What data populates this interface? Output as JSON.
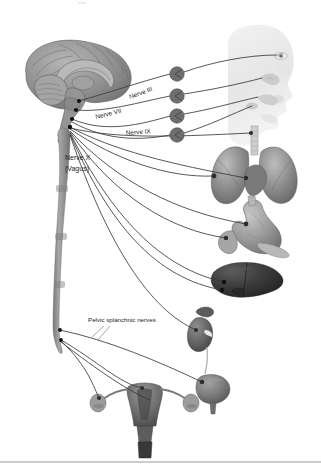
{
  "figure": {
    "background_color": "#ffffff",
    "width": 321,
    "height": 475
  },
  "labels": [
    {
      "id": "nerve-3",
      "text": "Nerve III",
      "x": 130,
      "y": 99,
      "rotate": -20,
      "size": 6.4
    },
    {
      "id": "nerve-7",
      "text": "Nerve VII",
      "x": 96,
      "y": 119,
      "rotate": -14,
      "size": 6.4
    },
    {
      "id": "nerve-9",
      "text": "Nerve IX",
      "x": 126,
      "y": 135,
      "rotate": -4,
      "size": 6.4
    },
    {
      "id": "nerve-10",
      "text": "Nerve X",
      "x": 65,
      "y": 160,
      "rotate": 0,
      "size": 7.0
    },
    {
      "id": "vagus",
      "text": "(Vagus)",
      "x": 65,
      "y": 171,
      "rotate": 0,
      "size": 7.0
    },
    {
      "id": "pelvic",
      "text": "Pelvic splanchnic nerves",
      "x": 88,
      "y": 322,
      "rotate": 0,
      "size": 6.2
    }
  ],
  "organs": [
    {
      "id": "brain",
      "name": "brain-sagittal-section",
      "tone": "#8f8f8f"
    },
    {
      "id": "spinal-cord",
      "name": "spinal-cord",
      "tone": "#9b9b9b"
    },
    {
      "id": "head-profile",
      "name": "head-profile-silhouette",
      "tone": "#ededed"
    },
    {
      "id": "eye",
      "name": "eye-target",
      "tone": "#cfcfcf"
    },
    {
      "id": "lacrimal",
      "name": "lacrimal-gland",
      "tone": "#c9c9c9"
    },
    {
      "id": "salivary",
      "name": "salivary-glands",
      "tone": "#cbcbcb"
    },
    {
      "id": "lungs",
      "name": "lungs-and-trachea",
      "tone": "#8c8c8c"
    },
    {
      "id": "heart",
      "name": "heart",
      "tone": "#787878"
    },
    {
      "id": "stomach",
      "name": "stomach-and-duodenum",
      "tone": "#9a9a9a"
    },
    {
      "id": "pancreas",
      "name": "pancreas",
      "tone": "#b4b4b4"
    },
    {
      "id": "liver",
      "name": "liver",
      "tone": "#3b3b3b"
    },
    {
      "id": "kidney",
      "name": "kidney-and-adrenal",
      "tone": "#6a6a6a"
    },
    {
      "id": "bladder",
      "name": "urinary-bladder",
      "tone": "#7b7b7b"
    },
    {
      "id": "uterus",
      "name": "uterus-ovaries",
      "tone": "#6f6f6f"
    }
  ],
  "ganglia": [
    {
      "id": "ciliary-ganglion",
      "cx": 177,
      "cy": 74,
      "r": 7.2
    },
    {
      "id": "pterygopalatine-ganglion",
      "cx": 177,
      "cy": 96,
      "r": 7.2
    },
    {
      "id": "submandibular-ganglion",
      "cx": 177,
      "cy": 116,
      "r": 7.2
    },
    {
      "id": "otic-ganglion",
      "cx": 177,
      "cy": 135,
      "r": 7.2
    }
  ],
  "origin_dots": [
    {
      "id": "origin-nerve-3",
      "cx": 79,
      "cy": 101
    },
    {
      "id": "origin-nerve-7",
      "cx": 76,
      "cy": 110
    },
    {
      "id": "origin-nerve-9",
      "cx": 72,
      "cy": 119
    },
    {
      "id": "origin-nerve-10",
      "cx": 70,
      "cy": 127
    },
    {
      "id": "origin-pelvic-1",
      "cx": 60,
      "cy": 330
    },
    {
      "id": "origin-pelvic-2",
      "cx": 61,
      "cy": 340
    }
  ],
  "colors": {
    "nerve_stroke": "#3a3a3a",
    "leader_stroke": "#6b6b6b",
    "label_text": "#1b1b1b",
    "footer_rule": "#9a9a9a",
    "brain_fill": "#8f8f8f",
    "cord_fill": "#9b9b9b",
    "ganglion_fill": "#6e6e6e"
  },
  "footer": {
    "rule_y": 462
  }
}
